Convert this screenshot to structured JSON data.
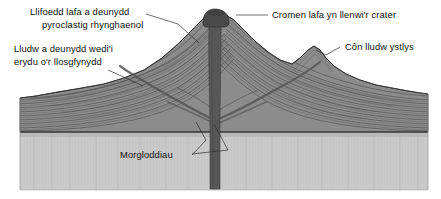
{
  "figure": {
    "type": "geological-block-diagram",
    "language": "cy",
    "background_color": "#ffffff"
  },
  "labels": {
    "interbedded_lava": {
      "line1": "Llifoedd lafa a deunydd",
      "line2": "pyroclastig rhynghaenol"
    },
    "eroded_ash": {
      "line1": "Lludw a deunydd wedi'i",
      "line2": "erydu o'r llosgfynydd"
    },
    "lava_dome": {
      "line1": "Cromen lafa yn llenwi'r crater"
    },
    "flank_cone": {
      "line1": "Côn lludw ystlys"
    },
    "dikes": {
      "line1": "Morgloddiau"
    }
  },
  "colors": {
    "basement_fill": "#c9c9c9",
    "basement_top_band": "#bdbdbd",
    "volcano_fill": "#8e8e8e",
    "volcano_fill_dark": "#7a7a7a",
    "conduit_fill": "#5a5a5a",
    "dome_fill": "#4e4e4e",
    "stroke": "#2f2f2f",
    "text": "#111111",
    "page_background": "#ffffff"
  },
  "features": [
    {
      "name": "summit-lava-dome",
      "position": "summit-center"
    },
    {
      "name": "central-conduit",
      "position": "center-vertical"
    },
    {
      "name": "flank-cinder-cone",
      "position": "right-flank"
    },
    {
      "name": "dikes",
      "position": "radiating-from-conduit"
    },
    {
      "name": "layered-strata",
      "position": "volcano-body"
    },
    {
      "name": "basement-rock",
      "position": "below-volcano"
    }
  ]
}
